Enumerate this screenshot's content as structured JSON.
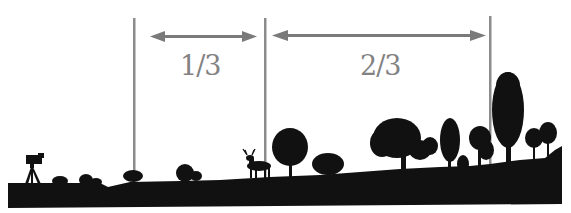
{
  "diagram": {
    "title": "",
    "colors": {
      "silhouette": "#111111",
      "guide_line": "#8c8c8c",
      "arrow": "#7a7a7a",
      "label": "#828282",
      "background": "#ffffff"
    },
    "guides": [
      {
        "name": "left-guide",
        "x": 134
      },
      {
        "name": "middle-guide",
        "x": 265
      },
      {
        "name": "right-guide",
        "x": 490
      }
    ],
    "segments": [
      {
        "name": "near-third",
        "label": "1/3",
        "from_x": 150,
        "to_x": 256
      },
      {
        "name": "far-two-thirds",
        "label": "2/3",
        "from_x": 273,
        "to_x": 485
      }
    ],
    "scene": {
      "elements": [
        "camera-on-tripod",
        "shrubs",
        "deer",
        "trees",
        "cypress-tree",
        "ground"
      ]
    }
  }
}
